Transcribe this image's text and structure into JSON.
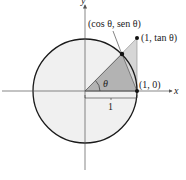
{
  "diagram": {
    "type": "unit-circle",
    "axes": {
      "x_label": "x",
      "y_label": "y"
    },
    "points": {
      "cos_sin": {
        "label": "(cos θ, sen θ)"
      },
      "tan": {
        "label": "(1, tan θ)"
      },
      "one_zero": {
        "label": "(1, 0)"
      }
    },
    "angle_label": "θ",
    "radius_label": "1",
    "colors": {
      "circle_fill": "#f0f0f0",
      "circle_stroke": "#1a1a1a",
      "outer_triangle_fill": "#d6d6d6",
      "inner_triangle_fill": "#b3b3b3",
      "axis": "#555555"
    }
  }
}
